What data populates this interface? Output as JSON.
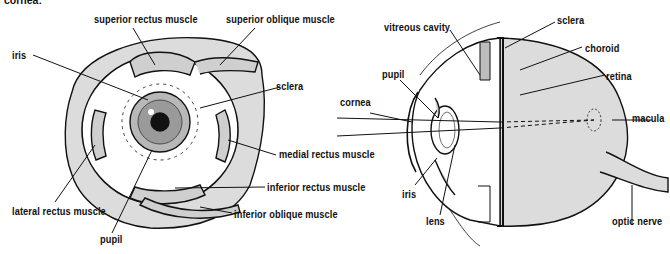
{
  "figure": {
    "cropped_heading": "cornea:",
    "fill_color": "#dcdcdc",
    "line_color": "#111111"
  },
  "front_view": {
    "labels": {
      "superior_rectus": "superior rectus muscle",
      "superior_oblique": "superior oblique muscle",
      "iris": "iris",
      "sclera": "sclera",
      "medial_rectus": "medial rectus muscle",
      "inferior_rectus": "inferior rectus muscle",
      "lateral_rectus": "lateral rectus muscle",
      "inferior_oblique": "inferior oblique muscle",
      "pupil": "pupil"
    },
    "signature": "Alton Pascals"
  },
  "cross_section": {
    "labels": {
      "vitreous_cavity": "vitreous cavity",
      "sclera": "sclera",
      "choroid": "choroid",
      "retina": "retina",
      "pupil": "pupil",
      "cornea": "cornea",
      "macula": "macula",
      "iris": "iris",
      "lens": "lens",
      "optic_nerve": "optic nerve"
    },
    "signature": "Alton Pascals"
  }
}
